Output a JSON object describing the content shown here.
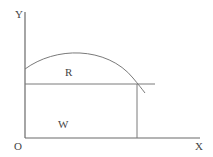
{
  "diagram": {
    "type": "economics-graph",
    "labels": {
      "y_axis": "Y",
      "x_axis": "X",
      "origin": "O",
      "upper_region": "R",
      "lower_region": "W"
    },
    "colors": {
      "background": "#ffffff",
      "lines": "#7a7a7a",
      "text": "#444444"
    }
  }
}
